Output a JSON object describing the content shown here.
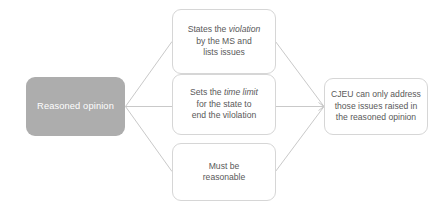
{
  "diagram": {
    "type": "flow-diagram",
    "colors": {
      "source_fill": "#adadad",
      "source_text": "#ffffff",
      "node_fill": "#ffffff",
      "node_border": "#d6d6d6",
      "node_text": "#595959",
      "connector": "#c9c9c9",
      "background": "#ffffff"
    },
    "source_node": {
      "id": "reasoned-opinion",
      "label": "Reasoned opinion"
    },
    "step_nodes": [
      {
        "id": "states-violation",
        "line1_prefix": "States the ",
        "line1_emphasis": "violation",
        "line2": "by the MS and",
        "line3": "lists issues"
      },
      {
        "id": "time-limit",
        "line1_prefix": "Sets the ",
        "line1_emphasis": "time limit",
        "line2": "for the state to",
        "line3": "end the vilolation"
      },
      {
        "id": "reasonable",
        "line1_prefix": "",
        "line1_emphasis": "",
        "line2": "Must be",
        "line3": "reasonable"
      }
    ],
    "result_node": {
      "id": "cjeu-scope",
      "line1": "CJEU can only address",
      "line2": "those issues raised in",
      "line3": "the reasoned opinion"
    },
    "connectors": [
      {
        "id": "source-to-states-violation",
        "from": "reasoned-opinion",
        "to": "states-violation"
      },
      {
        "id": "source-to-time-limit",
        "from": "reasoned-opinion",
        "to": "time-limit"
      },
      {
        "id": "source-to-reasonable",
        "from": "reasoned-opinion",
        "to": "reasonable"
      },
      {
        "id": "states-violation-to-cjeu",
        "from": "states-violation",
        "to": "cjeu-scope"
      },
      {
        "id": "time-limit-to-cjeu",
        "from": "time-limit",
        "to": "cjeu-scope"
      },
      {
        "id": "reasonable-to-cjeu",
        "from": "reasonable",
        "to": "cjeu-scope"
      }
    ]
  }
}
